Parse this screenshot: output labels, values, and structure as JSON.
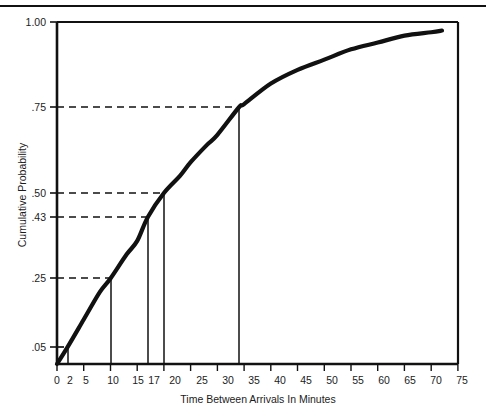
{
  "figure": {
    "kind": "statistical-plot",
    "background_color": "#ffffff",
    "ink_color": "#111111"
  },
  "chart_data": {
    "type": "line",
    "title": "",
    "subtitle": "",
    "xlabel": "Time Between Arrivals In Minutes",
    "ylabel": "Cumulative Probability",
    "xlim": [
      0,
      75
    ],
    "ylim": [
      0,
      1.0
    ],
    "grid": false,
    "legend": null,
    "x_tick_values": [
      0,
      2,
      5,
      10,
      15,
      17,
      20,
      25,
      30,
      35,
      40,
      45,
      50,
      55,
      60,
      65,
      70,
      75
    ],
    "x_tick_labels": [
      "0",
      "2",
      "5",
      "10",
      "15",
      "17",
      "20",
      "25",
      "30",
      "35",
      "40",
      "45",
      "50",
      "55",
      "60",
      "65",
      "70",
      "75"
    ],
    "x_major_ticks": [
      0,
      5,
      10,
      15,
      20,
      25,
      30,
      35,
      40,
      45,
      50,
      55,
      60,
      65,
      70,
      75
    ],
    "y_tick_values": [
      0.05,
      0.25,
      0.43,
      0.5,
      0.75,
      1.0
    ],
    "y_tick_labels": [
      ".05",
      ".25",
      ".43",
      ".50",
      ".75",
      "1.00"
    ],
    "series": [
      {
        "name": "Cumulative probability curve",
        "style": "solid-thick",
        "x": [
          0,
          2,
          5,
          8,
          10,
          13,
          15,
          17,
          20,
          23,
          25,
          28,
          30,
          34,
          35,
          40,
          45,
          50,
          55,
          60,
          65,
          70,
          72
        ],
        "values": [
          0.0,
          0.05,
          0.13,
          0.21,
          0.25,
          0.32,
          0.36,
          0.43,
          0.5,
          0.55,
          0.59,
          0.64,
          0.67,
          0.75,
          0.76,
          0.82,
          0.86,
          0.89,
          0.92,
          0.94,
          0.96,
          0.97,
          0.975
        ]
      }
    ],
    "reference_lines": [
      {
        "label": ".05",
        "y": 0.05,
        "x": 2,
        "style": "dashed-horizontal-plus-vertical-dropline"
      },
      {
        "label": ".25",
        "y": 0.25,
        "x": 10,
        "style": "dashed-horizontal-plus-vertical-dropline"
      },
      {
        "label": ".43",
        "y": 0.43,
        "x": 17,
        "style": "dashed-horizontal-plus-vertical-dropline"
      },
      {
        "label": ".50",
        "y": 0.5,
        "x": 20,
        "style": "dashed-horizontal-plus-vertical-dropline"
      },
      {
        "label": ".75",
        "y": 0.75,
        "x": 34,
        "style": "dashed-horizontal-plus-vertical-dropline"
      }
    ],
    "annotations": []
  }
}
